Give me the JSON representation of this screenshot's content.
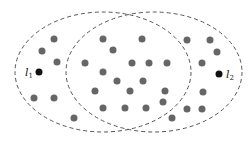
{
  "diagram": {
    "type": "overlapping-ellipses-point-set",
    "ellipses": [
      {
        "name": "left-ellipse",
        "cx": 103,
        "cy": 72,
        "rx": 88,
        "ry": 60,
        "stroke": "#555555",
        "dash": "4 3"
      },
      {
        "name": "right-ellipse",
        "cx": 154,
        "cy": 72,
        "rx": 88,
        "ry": 60,
        "stroke": "#555555",
        "dash": "4 3"
      }
    ],
    "dot_color": "#666666",
    "highlight_color": "#111111",
    "dot_radius": 3.5,
    "dots": [
      [
        54,
        39
      ],
      [
        42,
        51
      ],
      [
        57,
        62
      ],
      [
        34,
        98
      ],
      [
        54,
        98
      ],
      [
        103,
        39
      ],
      [
        142,
        39
      ],
      [
        113,
        50
      ],
      [
        85,
        63
      ],
      [
        132,
        63
      ],
      [
        149,
        63
      ],
      [
        167,
        63
      ],
      [
        103,
        72
      ],
      [
        117,
        81
      ],
      [
        143,
        81
      ],
      [
        95,
        91
      ],
      [
        130,
        91
      ],
      [
        165,
        91
      ],
      [
        163,
        102
      ],
      [
        103,
        108
      ],
      [
        125,
        108
      ],
      [
        146,
        108
      ],
      [
        74,
        118
      ],
      [
        172,
        118
      ],
      [
        187,
        40
      ],
      [
        210,
        40
      ],
      [
        217,
        52
      ],
      [
        202,
        63
      ],
      [
        203,
        92
      ],
      [
        187,
        109
      ],
      [
        202,
        109
      ]
    ],
    "highlighted_points": [
      {
        "name": "l1",
        "x": 39,
        "y": 72,
        "label": "l",
        "subscript": "1",
        "label_x": 25,
        "label_y": 76
      },
      {
        "name": "l2",
        "x": 219,
        "y": 74,
        "label": "l",
        "subscript": "2",
        "label_x": 226,
        "label_y": 78
      }
    ]
  }
}
